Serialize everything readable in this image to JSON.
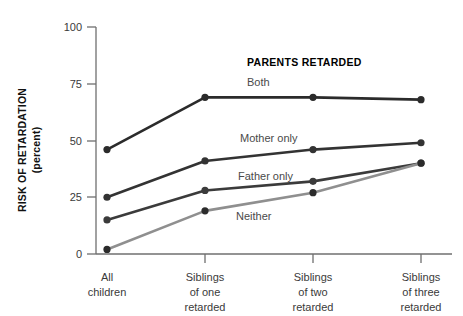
{
  "chart_data": {
    "type": "line",
    "title": "",
    "legend_title": "PARENTS RETARDED",
    "legend_position": "inline-right-of-lines",
    "xlabel": "",
    "ylabel": "RISK OF RETARDATION",
    "ylabel_sub": "(percent)",
    "ylim": [
      0,
      100
    ],
    "yticks": [
      0,
      25,
      50,
      75,
      100
    ],
    "ytick_labels": [
      "0",
      "25",
      "50",
      "75",
      "100"
    ],
    "grid": false,
    "categories": [
      "All children",
      "Siblings of one retarded",
      "Siblings of two retarded",
      "Siblings of three retarded"
    ],
    "category_lines": [
      [
        "All",
        "children"
      ],
      [
        "Siblings",
        "of one",
        "retarded"
      ],
      [
        "Siblings",
        "of two",
        "retarded"
      ],
      [
        "Siblings",
        "of three",
        "retarded"
      ]
    ],
    "series": [
      {
        "name": "Both",
        "color": "#2b2b2b",
        "values": [
          46,
          69,
          69,
          68
        ],
        "label_x": 247,
        "label_y": 86
      },
      {
        "name": "Mother only",
        "color": "#333333",
        "values": [
          25,
          41,
          46,
          49
        ],
        "label_x": 240,
        "label_y": 142
      },
      {
        "name": "Father only",
        "color": "#3b3b3b",
        "values": [
          15,
          28,
          32,
          40
        ],
        "label_x": 238,
        "label_y": 180
      },
      {
        "name": "Neither",
        "color": "#8f8f8f",
        "values": [
          2,
          19,
          27,
          40
        ],
        "label_x": 236,
        "label_y": 220
      }
    ]
  },
  "axis": {
    "y_tick_0": "0",
    "y_tick_25": "25",
    "y_tick_50": "50",
    "y_tick_75": "75",
    "y_tick_100": "100",
    "y_title_main": "RISK OF RETARDATION",
    "y_title_sub": "(percent)"
  },
  "legend": {
    "title": "PARENTS RETARDED",
    "items": [
      {
        "label": "Both"
      },
      {
        "label": "Mother only"
      },
      {
        "label": "Father only"
      },
      {
        "label": "Neither"
      }
    ]
  },
  "xcats": {
    "c0_l0": "All",
    "c0_l1": "children",
    "c1_l0": "Siblings",
    "c1_l1": "of one",
    "c1_l2": "retarded",
    "c2_l0": "Siblings",
    "c2_l1": "of two",
    "c2_l2": "retarded",
    "c3_l0": "Siblings",
    "c3_l1": "of three",
    "c3_l2": "retarded"
  },
  "colors": {
    "axis": "#6f6f6f",
    "dark_line": "#2b2b2b",
    "gray_line": "#8f8f8f",
    "text": "#3a3a3a",
    "title_text": "#000000"
  }
}
